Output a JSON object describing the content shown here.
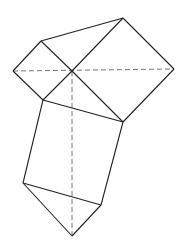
{
  "diagram": {
    "type": "geometric-figure",
    "colors": {
      "line": "#222222",
      "dashed": "#777777",
      "background": "#ffffff"
    },
    "points": {
      "O": [
        72,
        71
      ],
      "A": [
        41,
        41
      ],
      "B": [
        13,
        71
      ],
      "C": [
        43,
        100
      ],
      "D": [
        123,
        18
      ],
      "E": [
        174,
        69
      ],
      "F": [
        123,
        122
      ],
      "G": [
        23,
        183
      ],
      "H": [
        101,
        205
      ],
      "I": [
        72,
        236
      ]
    },
    "solid_segments": [
      [
        "A",
        "B"
      ],
      [
        "B",
        "C"
      ],
      [
        "A",
        "O"
      ],
      [
        "O",
        "C"
      ],
      [
        "A",
        "D"
      ],
      [
        "D",
        "O"
      ],
      [
        "D",
        "E"
      ],
      [
        "E",
        "F"
      ],
      [
        "O",
        "F"
      ],
      [
        "C",
        "F"
      ],
      [
        "C",
        "G"
      ],
      [
        "F",
        "H"
      ],
      [
        "G",
        "H"
      ],
      [
        "G",
        "I"
      ],
      [
        "H",
        "I"
      ]
    ],
    "dashed_segments": [
      [
        "B",
        "E"
      ],
      [
        "O",
        "I"
      ]
    ]
  }
}
